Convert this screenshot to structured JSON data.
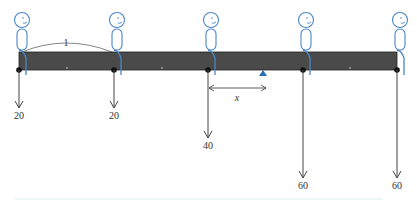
{
  "diagram": {
    "beam": {
      "x_start": 19,
      "x_end": 397,
      "y_top": 52,
      "y_bottom": 70,
      "color": "#4a4a4a"
    },
    "spacing_label": "1",
    "distance_label": "x",
    "fulcrum": {
      "x": 263,
      "color": "#2a6db5"
    },
    "loads": [
      {
        "x": 19,
        "value": "20",
        "arrow_end": 108
      },
      {
        "x": 114,
        "value": "20",
        "arrow_end": 108
      },
      {
        "x": 208,
        "value": "40",
        "arrow_end": 138
      },
      {
        "x": 303,
        "value": "60",
        "arrow_end": 178
      },
      {
        "x": 397,
        "value": "60",
        "arrow_end": 178
      }
    ],
    "people_color": "#4a86c8",
    "ticks": [
      67,
      162,
      350
    ]
  }
}
